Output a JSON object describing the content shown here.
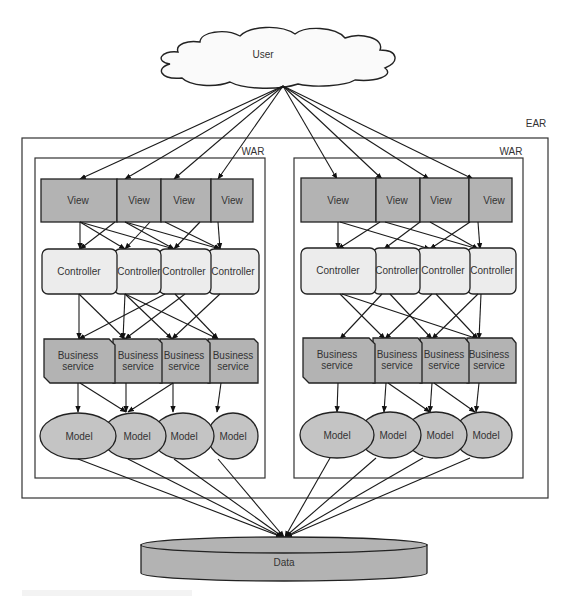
{
  "diagram": {
    "user_label": "User",
    "ear_label": "EAR",
    "data_label": "Data",
    "wars": [
      {
        "label": "WAR",
        "views": [
          "View",
          "View",
          "View",
          "View"
        ],
        "controllers": [
          "Controller",
          "Controller",
          "Controller",
          "Controller"
        ],
        "business_services": [
          {
            "line1": "Business",
            "line2": "service"
          },
          {
            "line1": "Business",
            "line2": "service"
          },
          {
            "line1": "Business",
            "line2": "service"
          },
          {
            "line1": "Business",
            "line2": "service"
          }
        ],
        "models": [
          "Model",
          "Model",
          "Model",
          "Model"
        ]
      },
      {
        "label": "WAR",
        "views": [
          "View",
          "View",
          "View",
          "View"
        ],
        "controllers": [
          "Controller",
          "Controller",
          "Controller",
          "Controller"
        ],
        "business_services": [
          {
            "line1": "Business",
            "line2": "service"
          },
          {
            "line1": "Business",
            "line2": "service"
          },
          {
            "line1": "Business",
            "line2": "service"
          },
          {
            "line1": "Business",
            "line2": "service"
          }
        ],
        "models": [
          "Model",
          "Model",
          "Model",
          "Model"
        ]
      }
    ],
    "colors": {
      "view_fill": "#b3b3b3",
      "controller_fill": "#ececec",
      "business_fill": "#b3b3b3",
      "model_fill": "#c4c4c4",
      "data_fill": "#b3b3b3",
      "stroke": "#222222"
    }
  }
}
